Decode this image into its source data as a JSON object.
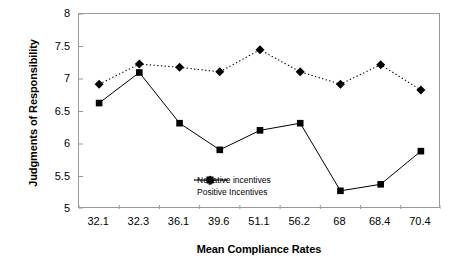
{
  "chart_data": {
    "type": "line",
    "title": "",
    "xlabel": "Mean Compliance Rates",
    "ylabel": "Judgments of Responsibility",
    "categories": [
      "32.1",
      "32.3",
      "36.1",
      "39.6",
      "51.1",
      "56.2",
      "68",
      "68.4",
      "70.4"
    ],
    "ylim": [
      5,
      8
    ],
    "yticks": [
      "5",
      "5.5",
      "6",
      "6.5",
      "7",
      "7.5",
      "8"
    ],
    "ytick_values": [
      5,
      5.5,
      6,
      6.5,
      7,
      7.5,
      8
    ],
    "grid": false,
    "legend_position": "inside-lower-left",
    "series": [
      {
        "name": "Negative incentives",
        "marker": "square",
        "linestyle": "solid",
        "color": "#000000",
        "values": [
          6.63,
          7.1,
          6.32,
          5.91,
          6.21,
          6.32,
          5.28,
          5.38,
          5.89
        ]
      },
      {
        "name": "Positive Incentives",
        "marker": "diamond",
        "linestyle": "dotted",
        "color": "#000000",
        "values": [
          6.92,
          7.23,
          7.18,
          7.11,
          7.45,
          7.11,
          6.92,
          7.22,
          6.83
        ]
      }
    ]
  },
  "axis": {
    "frame_color": "#9a9a9a"
  }
}
